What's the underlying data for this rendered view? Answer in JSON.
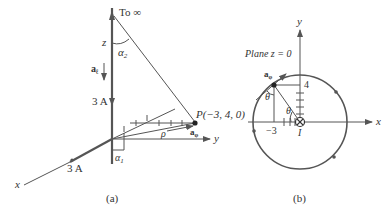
{
  "panel_a": {
    "caption": "(a)",
    "to_infinity": "To ∞",
    "z_label": "z",
    "alpha2": "α",
    "alpha2_sub": "2",
    "a_l": "a",
    "a_l_sub": "ℓ",
    "current_upper": "3 A",
    "current_lower": "3 A",
    "point_label": "P(−3, 4, 0)",
    "rho": "ρ",
    "a_phi": "a",
    "a_phi_sub": "φ",
    "y_label": "y",
    "x_label": "x",
    "alpha1": "α",
    "alpha1_sub": "1"
  },
  "panel_b": {
    "caption": "(b)",
    "plane_label": "Plane z = 0",
    "y_label": "y",
    "x_label": "x",
    "a_phi": "a",
    "a_phi_sub": "φ",
    "theta_upper": "θ",
    "theta_lower": "θ",
    "tick_4": "4",
    "tick_neg3": "−3",
    "current_label": "I"
  },
  "colors": {
    "line": "#555555",
    "text": "#333333",
    "background": "#ffffff"
  }
}
